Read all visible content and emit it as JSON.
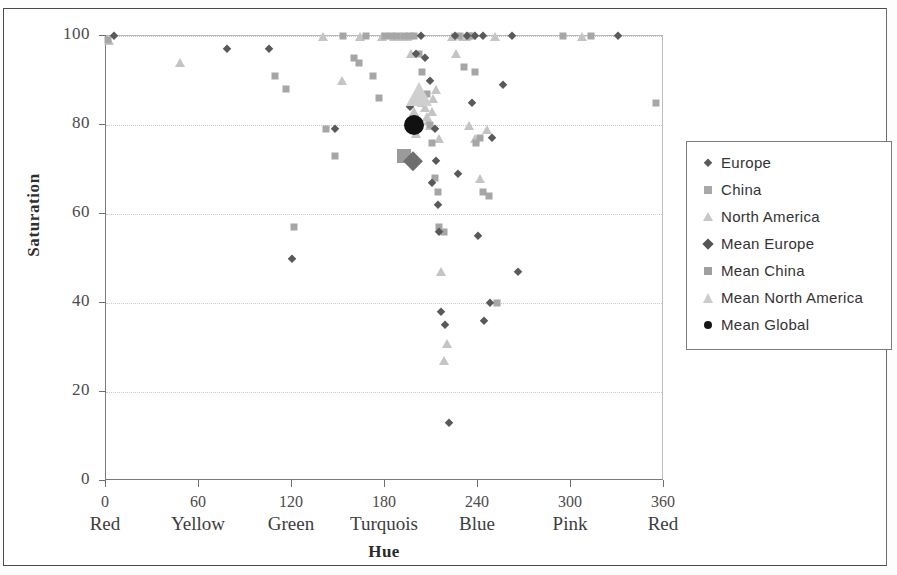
{
  "chart_data": {
    "type": "scatter",
    "title": "",
    "xlabel": "Hue",
    "ylabel": "Saturation",
    "xlim": [
      0,
      360
    ],
    "ylim": [
      0,
      100
    ],
    "grid": true,
    "legend_position": "right",
    "x_ticks": [
      {
        "value": 0,
        "label": "0",
        "name": "Red"
      },
      {
        "value": 60,
        "label": "60",
        "name": "Yellow"
      },
      {
        "value": 120,
        "label": "120",
        "name": "Green"
      },
      {
        "value": 180,
        "label": "180",
        "name": "Turquois"
      },
      {
        "value": 240,
        "label": "240",
        "name": "Blue"
      },
      {
        "value": 300,
        "label": "300",
        "name": "Pink"
      },
      {
        "value": 360,
        "label": "360",
        "name": "Red"
      }
    ],
    "y_ticks": [
      {
        "value": 0,
        "label": "0"
      },
      {
        "value": 20,
        "label": "20"
      },
      {
        "value": 40,
        "label": "40"
      },
      {
        "value": 60,
        "label": "60"
      },
      {
        "value": 80,
        "label": "80"
      },
      {
        "value": 100,
        "label": "100"
      }
    ],
    "series": [
      {
        "name": "Europe",
        "marker": "diamond",
        "color": "#595959",
        "size": 9,
        "points": [
          [
            5,
            100
          ],
          [
            78,
            97
          ],
          [
            105,
            97
          ],
          [
            120,
            50
          ],
          [
            148,
            79
          ],
          [
            196,
            84
          ],
          [
            200,
            96
          ],
          [
            203,
            100
          ],
          [
            206,
            95
          ],
          [
            209,
            90
          ],
          [
            210,
            67
          ],
          [
            212,
            79
          ],
          [
            213,
            72
          ],
          [
            214,
            62
          ],
          [
            215,
            56
          ],
          [
            216,
            38
          ],
          [
            219,
            35
          ],
          [
            221,
            13
          ],
          [
            225,
            100
          ],
          [
            227,
            69
          ],
          [
            233,
            100
          ],
          [
            236,
            85
          ],
          [
            238,
            100
          ],
          [
            240,
            55
          ],
          [
            243,
            100
          ],
          [
            244,
            36
          ],
          [
            248,
            40
          ],
          [
            249,
            77
          ],
          [
            256,
            89
          ],
          [
            262,
            100
          ],
          [
            266,
            47
          ],
          [
            330,
            100
          ]
        ]
      },
      {
        "name": "China",
        "marker": "square",
        "color": "#a6a6a6",
        "size": 7,
        "points": [
          [
            1,
            99
          ],
          [
            109,
            91
          ],
          [
            116,
            88
          ],
          [
            121,
            57
          ],
          [
            142,
            79
          ],
          [
            148,
            73
          ],
          [
            153,
            100
          ],
          [
            160,
            95
          ],
          [
            163,
            94
          ],
          [
            168,
            100
          ],
          [
            172,
            91
          ],
          [
            176,
            86
          ],
          [
            180,
            100
          ],
          [
            184,
            100
          ],
          [
            188,
            100
          ],
          [
            192,
            100
          ],
          [
            196,
            100
          ],
          [
            199,
            100
          ],
          [
            202,
            96
          ],
          [
            204,
            92
          ],
          [
            207,
            87
          ],
          [
            209,
            80
          ],
          [
            210,
            76
          ],
          [
            212,
            68
          ],
          [
            214,
            65
          ],
          [
            215,
            57
          ],
          [
            218,
            56
          ],
          [
            228,
            100
          ],
          [
            231,
            93
          ],
          [
            234,
            100
          ],
          [
            236,
            100
          ],
          [
            238,
            92
          ],
          [
            239,
            76
          ],
          [
            241,
            77
          ],
          [
            243,
            65
          ],
          [
            247,
            64
          ],
          [
            252,
            40
          ],
          [
            295,
            100
          ],
          [
            313,
            100
          ],
          [
            355,
            85
          ]
        ]
      },
      {
        "name": "North America",
        "marker": "triangle",
        "color": "#c4c4c4",
        "size": 9,
        "points": [
          [
            2,
            99
          ],
          [
            48,
            94
          ],
          [
            140,
            100
          ],
          [
            152,
            90
          ],
          [
            164,
            100
          ],
          [
            178,
            100
          ],
          [
            186,
            100
          ],
          [
            190,
            100
          ],
          [
            194,
            100
          ],
          [
            197,
            96
          ],
          [
            199,
            83
          ],
          [
            200,
            78
          ],
          [
            202,
            87
          ],
          [
            204,
            85
          ],
          [
            206,
            84
          ],
          [
            207,
            82
          ],
          [
            208,
            81
          ],
          [
            209,
            80
          ],
          [
            210,
            83
          ],
          [
            211,
            86
          ],
          [
            213,
            88
          ],
          [
            215,
            77
          ],
          [
            216,
            47
          ],
          [
            218,
            27
          ],
          [
            220,
            31
          ],
          [
            223,
            100
          ],
          [
            226,
            96
          ],
          [
            230,
            100
          ],
          [
            232,
            100
          ],
          [
            234,
            80
          ],
          [
            238,
            77
          ],
          [
            241,
            68
          ],
          [
            246,
            79
          ],
          [
            251,
            100
          ],
          [
            307,
            100
          ]
        ]
      },
      {
        "name": "Mean Europe",
        "marker": "diamond",
        "color": "#6e6e6e",
        "size": 19,
        "points": [
          [
            198,
            72
          ]
        ]
      },
      {
        "name": "Mean China",
        "marker": "square",
        "color": "#9b9b9b",
        "size": 14,
        "points": [
          [
            192,
            73
          ]
        ]
      },
      {
        "name": "Mean North America",
        "marker": "triangle",
        "color": "#cfcfcf",
        "size": 24,
        "points": [
          [
            202,
            87
          ]
        ]
      },
      {
        "name": "Mean Global",
        "marker": "circle",
        "color": "#111111",
        "size": 20,
        "points": [
          [
            199,
            80
          ]
        ]
      }
    ]
  },
  "legend": {
    "items": [
      {
        "label": "Europe",
        "marker": "diamond",
        "color": "#5a5a5a",
        "size": 9
      },
      {
        "label": "China",
        "marker": "square",
        "color": "#a8a8a8",
        "size": 8
      },
      {
        "label": "North America",
        "marker": "triangle",
        "color": "#c8c8c8",
        "size": 9
      },
      {
        "label": "Mean Europe",
        "marker": "diamond",
        "color": "#555555",
        "size": 11
      },
      {
        "label": "Mean China",
        "marker": "square",
        "color": "#a0a0a0",
        "size": 8
      },
      {
        "label": "Mean North America",
        "marker": "triangle",
        "color": "#cccccc",
        "size": 10
      },
      {
        "label": "Mean Global",
        "marker": "circle",
        "color": "#171717",
        "size": 8
      }
    ]
  }
}
